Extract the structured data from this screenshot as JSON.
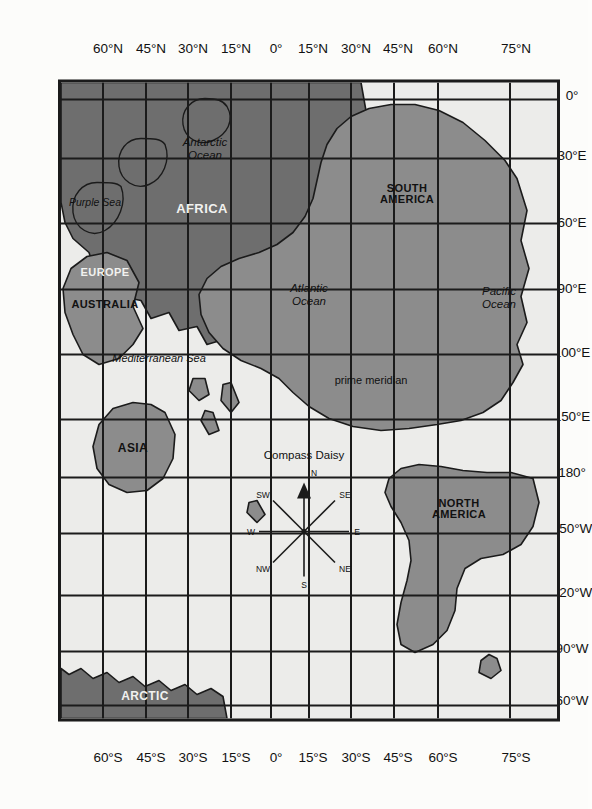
{
  "map": {
    "title": "World map with graticule",
    "orientation_note": "map drawn in landscape, displayed rotated 90 degrees",
    "ocean_color": "#ececea",
    "land_color": "#8c8c8c",
    "land_dark_color": "#6e6e6e",
    "line_color": "#1b1b1b",
    "latitude_labels": [
      "75°N",
      "60°N",
      "45°N",
      "30°N",
      "15°N",
      "0°",
      "15°N",
      "30°N",
      "45°N",
      "60°N"
    ],
    "latitude_labels_bottom": [
      "75°S",
      "60°S",
      "45°S",
      "30°S",
      "15°S",
      "0°",
      "15°S",
      "30°S",
      "45°S",
      "60°S"
    ],
    "longitude_labels": [
      "0°",
      "30°E",
      "60°E",
      "90°E",
      "100°E",
      "150°E",
      "180°",
      "150°W",
      "120°W",
      "90°W",
      "60°W"
    ],
    "continents": [
      {
        "name": "SOUTH\nAMERICA",
        "line1": "SOUTH",
        "line2": "AMERICA"
      },
      {
        "name": "NORTH\nAMERICA",
        "line1": "NORTH",
        "line2": "AMERICA"
      },
      {
        "name": "AFRICA"
      },
      {
        "name": "EUROPE"
      },
      {
        "name": "ASIA"
      },
      {
        "name": "AUSTRALIA"
      },
      {
        "name": "ARCTIC"
      }
    ],
    "labels": {
      "south_america_1": "SOUTH",
      "south_america_2": "AMERICA",
      "north_america_1": "NORTH",
      "north_america_2": "AMERICA",
      "africa": "AFRICA",
      "europe": "EUROPE",
      "asia": "ASIA",
      "australia": "AUSTRALIA",
      "arctic": "ARCTIC"
    },
    "waters": {
      "pacific_1": "Pacific",
      "pacific_2": "Ocean",
      "atlantic_1": "Atlantic",
      "atlantic_2": "Ocean",
      "antarctic_1": "Antarctic",
      "antarctic_2": "Ocean",
      "mediterranean": "Mediterranean Sea",
      "purple": "Purple Sea"
    },
    "annotations": {
      "prime_meridian": "prime meridian"
    }
  },
  "compass": {
    "title": "Compass Daisy",
    "directions": {
      "n": "N",
      "ne": "NE",
      "e": "E",
      "se": "SE",
      "s": "S",
      "sw": "SW",
      "w": "W",
      "nw": "NW"
    }
  }
}
